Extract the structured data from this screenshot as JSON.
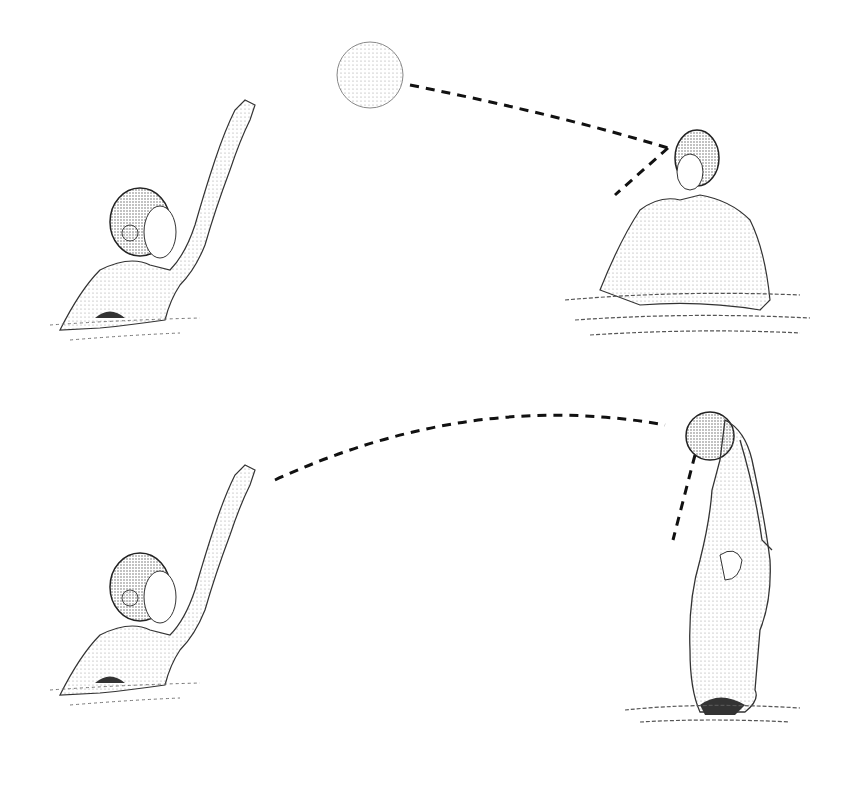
{
  "figure": {
    "panels": [
      {
        "name": "top",
        "thrower": "field player with arm raised after release",
        "ball": "ball in flight near top center",
        "receiver": "player in water facing ball",
        "trajectory": "dashed line from ball to receiver head"
      },
      {
        "name": "bottom",
        "thrower": "field player with arm raised after release",
        "ball": "ball caught overhead by receiver",
        "receiver": "player lunging up out of water with arms extended",
        "trajectory": "dashed arc from thrower hand to ball"
      }
    ]
  },
  "colors": {
    "ink": "#1a1a1a",
    "shade": "#6b6b6b",
    "light": "#bdbdbd",
    "background": "#ffffff"
  }
}
